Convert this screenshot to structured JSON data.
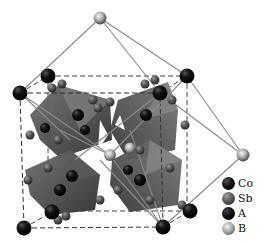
{
  "figure": {
    "colors": {
      "Co": "#0d0d0d",
      "Sb": "#4a4a4a",
      "A": "#111111",
      "B": "#9a9a9a",
      "octahedron_dark": "#3c3c3c",
      "octahedron_mid": "#6a6a6a",
      "bond_line": "#8a8a8a",
      "dash_line": "#444444"
    }
  },
  "legend": {
    "items": [
      {
        "label": "Co",
        "color": "#0d0d0d"
      },
      {
        "label": "Sb",
        "color": "#555555"
      },
      {
        "label": "A",
        "color": "#151515"
      },
      {
        "label": "B",
        "color": "#a0a0a0"
      }
    ]
  }
}
